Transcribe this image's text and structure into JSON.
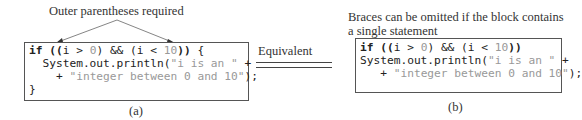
{
  "annotations": {
    "left_note": "Outer parentheses required",
    "right_note_line1": "Braces can be omitted if the block contains",
    "right_note_line2": "a single statement"
  },
  "left_code": {
    "line1": {
      "kw": "if",
      "open": " ((",
      "a": "i > ",
      "n1": "0",
      "b": ") && (i < ",
      "n2": "10",
      "close": "))",
      "tail": " {"
    },
    "line2": {
      "pre": "  System.out.println(",
      "str": "\"i is an \"",
      "post": " +"
    },
    "line3": {
      "pre": "    + ",
      "str": "\"integer between 0 and 10\"",
      "post": ");"
    },
    "line4": "}"
  },
  "right_code": {
    "line1": {
      "kw": "if",
      "open": " ((",
      "a": "i > ",
      "n1": "0",
      "b": ") && (i < ",
      "n2": "10",
      "close": "))"
    },
    "line2": {
      "pre": "System.out.println(",
      "str": "\"i is an \"",
      "post": " +"
    },
    "line3": {
      "pre": "   + ",
      "str": "\"integer between 0 and 10\"",
      "post": ");"
    }
  },
  "equivalent_label": "Equivalent",
  "captions": {
    "left": "(a)",
    "right": "(b)"
  }
}
